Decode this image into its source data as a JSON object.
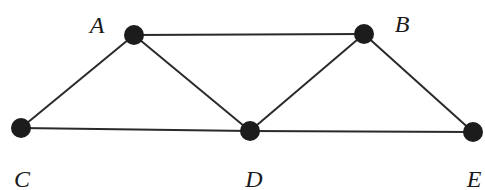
{
  "graph": {
    "nodes": [
      {
        "id": "A",
        "label": "A",
        "x": 134,
        "y": 35,
        "lx": 97,
        "ly": 33
      },
      {
        "id": "B",
        "label": "B",
        "x": 364,
        "y": 34,
        "lx": 402,
        "ly": 32
      },
      {
        "id": "C",
        "label": "C",
        "x": 21,
        "y": 128,
        "lx": 22,
        "ly": 187
      },
      {
        "id": "D",
        "label": "D",
        "x": 250,
        "y": 131,
        "lx": 254,
        "ly": 187
      },
      {
        "id": "E",
        "label": "E",
        "x": 473,
        "y": 132,
        "lx": 474,
        "ly": 187
      }
    ],
    "edges": [
      [
        "A",
        "B"
      ],
      [
        "A",
        "C"
      ],
      [
        "A",
        "D"
      ],
      [
        "B",
        "D"
      ],
      [
        "B",
        "E"
      ],
      [
        "C",
        "D"
      ],
      [
        "D",
        "E"
      ]
    ],
    "node_radius": 10,
    "colors": {
      "node": "#1c1c1c",
      "edge": "#2a2a2a",
      "label": "#1a1a1a"
    }
  }
}
